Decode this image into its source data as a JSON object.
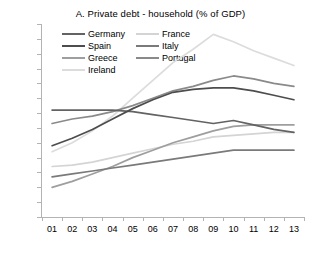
{
  "chart_data": {
    "type": "line",
    "title": "A. Private debt - household (% of GDP)",
    "xlabel": "",
    "ylabel": "",
    "ylim": [
      0,
      130
    ],
    "ytick_step": 10,
    "grid": false,
    "legend_position": "top-left-inside",
    "categories": [
      "01",
      "02",
      "03",
      "04",
      "05",
      "06",
      "07",
      "08",
      "09",
      "10",
      "11",
      "12",
      "13"
    ],
    "yticks": [
      "0",
      "10",
      "20",
      "30",
      "40",
      "50",
      "60",
      "70",
      "80",
      "90",
      "100",
      "110",
      "120",
      "130"
    ],
    "series": [
      {
        "name": "Germany",
        "color": "#636363",
        "values": [
          72,
          72,
          72,
          72,
          71,
          69,
          67,
          65,
          63,
          65,
          62,
          59,
          57
        ]
      },
      {
        "name": "France",
        "color": "#d4d4d4",
        "values": [
          34,
          35,
          37,
          40,
          43,
          46,
          49,
          51,
          54,
          55,
          56,
          57,
          57
        ]
      },
      {
        "name": "Spain",
        "color": "#4d4d4d",
        "values": [
          48,
          53,
          59,
          66,
          73,
          79,
          84,
          86,
          87,
          87,
          85,
          82,
          79
        ]
      },
      {
        "name": "Italy",
        "color": "#7a7a7a",
        "values": [
          27,
          29,
          31,
          33,
          35,
          37,
          39,
          41,
          43,
          45,
          45,
          45,
          45
        ]
      },
      {
        "name": "Greece",
        "color": "#9e9e9e",
        "values": [
          20,
          24,
          29,
          34,
          40,
          45,
          50,
          54,
          58,
          61,
          62,
          62,
          62
        ]
      },
      {
        "name": "Portugal",
        "color": "#8a8a8a",
        "values": [
          63,
          66,
          68,
          71,
          75,
          80,
          85,
          88,
          92,
          95,
          93,
          90,
          88
        ]
      },
      {
        "name": "Ireland",
        "color": "#dcdcdc",
        "values": [
          44,
          50,
          58,
          68,
          80,
          92,
          104,
          113,
          123,
          118,
          112,
          107,
          102
        ]
      }
    ],
    "legend_order": [
      "Germany",
      "France",
      "Spain",
      "Italy",
      "Greece",
      "Portugal",
      "Ireland"
    ]
  }
}
